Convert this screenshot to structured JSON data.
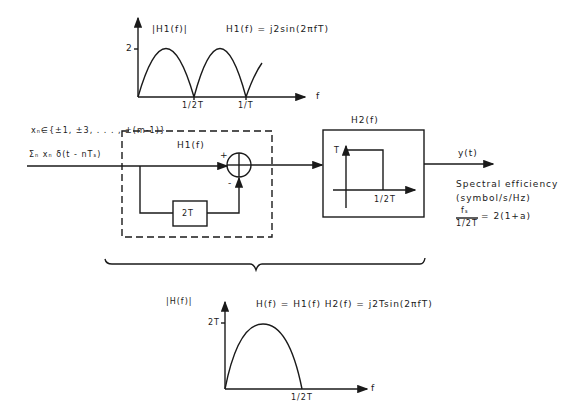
{
  "top_chart": {
    "y_label": "|H1(f)|",
    "formula": "H1(f) = j2sin(2πfT)",
    "y_tick": "2",
    "x_ticks": [
      "1/2T",
      "1/T"
    ],
    "x_axis_label": "f"
  },
  "input": {
    "alphabet": "xₙ∈{±1, ±3, . . . , ±(m-1)}",
    "signal": "Σₙ xₙ δ(t - nTₛ)"
  },
  "h1_block": {
    "title": "H1(f)",
    "plus": "+",
    "minus": "-",
    "delay_label": "2T"
  },
  "h2_block": {
    "title": "H2(f)",
    "y_tick": "T",
    "x_tick": "1/2T"
  },
  "output": {
    "label": "y(t)"
  },
  "spectral_efficiency": {
    "line1": "Spectral efficiency",
    "line2": "(symbol/s/Hz)",
    "numerator": "fₛ",
    "denominator": "1/2T",
    "rhs": "= 2(1+a)"
  },
  "bottom_chart": {
    "y_label": "|H(f)|",
    "formula": "H(f) = H1(f) H2(f) = j2Tsin(2πfT)",
    "y_tick": "2T",
    "x_tick": "1/2T",
    "x_axis_label": "f"
  }
}
